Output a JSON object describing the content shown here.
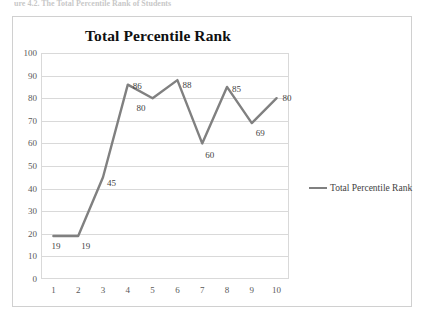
{
  "page": {
    "clipped_header_text": "ure 4.2. The Total Percentile Rank of Students"
  },
  "chart_data": {
    "type": "line",
    "title": "Total Percentile Rank",
    "xlabel": "",
    "ylabel": "",
    "categories": [
      "1",
      "2",
      "3",
      "4",
      "5",
      "6",
      "7",
      "8",
      "9",
      "10"
    ],
    "values": [
      19,
      19,
      45,
      86,
      80,
      88,
      60,
      85,
      69,
      80
    ],
    "data_labels": [
      "19",
      "19",
      "45",
      "86",
      "80",
      "88",
      "60",
      "85",
      "69",
      "80"
    ],
    "ylim": [
      0,
      100
    ],
    "ytick_step": 10,
    "yticks": [
      "0",
      "10",
      "20",
      "30",
      "40",
      "50",
      "60",
      "70",
      "80",
      "90",
      "100"
    ],
    "grid": true,
    "legend_position": "right",
    "series": [
      {
        "name": "Total Percentile Rank",
        "values": [
          19,
          19,
          45,
          86,
          80,
          88,
          60,
          85,
          69,
          80
        ],
        "color": "#808080"
      }
    ],
    "colors": {
      "line": "#808080",
      "gridline": "#d9d9d9",
      "plot_border": "#d9d9d9",
      "frame_border": "#d0d0d0",
      "title_text": "#101010",
      "axis_text": "#595959",
      "label_text": "#3f3f3f",
      "background": "#ffffff"
    }
  },
  "legend": {
    "entries": [
      {
        "label": "Total Percentile Rank"
      }
    ]
  }
}
